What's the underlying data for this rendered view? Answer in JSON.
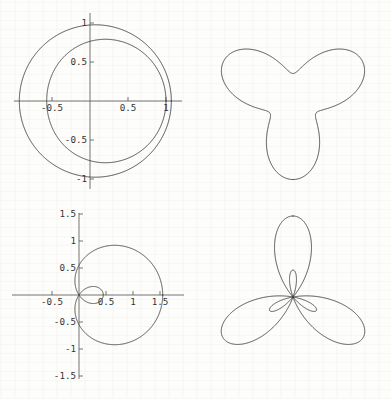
{
  "figure": {
    "width": 391,
    "height": 399,
    "background_color": "#fdfdfb",
    "curve_color": "#3b3b3b",
    "axis_color": "#5a5a5a",
    "layout": "2x2 grid"
  },
  "panels": [
    {
      "id": "top-left",
      "name": "limacon-convex-pair",
      "has_axes": true,
      "x_ticks": [
        "-0.5",
        "0.5",
        "1"
      ],
      "y_ticks": [
        "1",
        "0.5",
        "-0.5",
        "-1"
      ]
    },
    {
      "id": "top-right",
      "name": "rounded-triangle-rose",
      "has_axes": false,
      "x_ticks": [],
      "y_ticks": []
    },
    {
      "id": "bottom-left",
      "name": "limacon-with-inner-loop",
      "has_axes": true,
      "x_ticks": [
        "-0.5",
        "0.5",
        "1",
        "1.5"
      ],
      "y_ticks": [
        "1.5",
        "1",
        "0.5",
        "-0.5",
        "-1",
        "-1.5"
      ]
    },
    {
      "id": "bottom-right",
      "name": "three-petal-rose-with-inner-loops",
      "has_axes": false,
      "x_ticks": [],
      "y_ticks": []
    }
  ],
  "chart_data": [
    {
      "type": "line",
      "subtype": "polar",
      "panel": "top-left",
      "title": "",
      "xlabel": "",
      "ylabel": "",
      "xlim": [
        -1.15,
        1.15
      ],
      "ylim": [
        -1.15,
        1.15
      ],
      "grid": false,
      "axes_visible": true,
      "legend": "none",
      "xticks": [
        -0.5,
        0.5,
        1
      ],
      "xticklabels": [
        "-0.5",
        "0.5",
        "1"
      ],
      "yticks": [
        1,
        0.5,
        -0.5,
        -1
      ],
      "yticklabels": [
        "1",
        "0.5",
        "-0.5",
        "-1"
      ],
      "series": [
        {
          "name": "outer-circle",
          "equation": "r = 1 + 0.07 cos(theta)",
          "description": "near-circular closed curve through x=-1 and x=1.07",
          "theta_range_deg": [
            0,
            360
          ],
          "samples_theta_deg": [
            0,
            45,
            90,
            135,
            180,
            225,
            270,
            315
          ],
          "samples_r": [
            1.07,
            1.05,
            1.0,
            0.95,
            0.93,
            0.95,
            1.0,
            1.05
          ]
        },
        {
          "name": "inner-circle",
          "equation": "r = 0.79 + 0.22 cos(theta)",
          "description": "smaller closed curve through x=-1 at left and x=0.57 at right",
          "theta_range_deg": [
            0,
            360
          ],
          "samples_theta_deg": [
            0,
            45,
            90,
            135,
            180,
            225,
            270,
            315
          ],
          "samples_r": [
            0.57,
            0.7,
            0.62,
            0.84,
            1.0,
            0.84,
            0.62,
            0.7
          ]
        }
      ]
    },
    {
      "type": "line",
      "subtype": "polar",
      "panel": "top-right",
      "title": "",
      "xlabel": "",
      "ylabel": "",
      "grid": false,
      "axes_visible": false,
      "legend": "none",
      "series": [
        {
          "name": "rounded-triangle",
          "equation": "r = 2 + cos(3 theta)",
          "description": "convex rounded triangle, 3-fold symmetry, flat top and rounded bottom vertex",
          "theta_range_deg": [
            0,
            360
          ],
          "samples_theta_deg": [
            0,
            30,
            60,
            90,
            120,
            150,
            180,
            210,
            240,
            270,
            300,
            330
          ],
          "samples_r": [
            3,
            2,
            1,
            2,
            3,
            2,
            1,
            2,
            3,
            2,
            1,
            2
          ]
        }
      ]
    },
    {
      "type": "line",
      "subtype": "polar",
      "panel": "bottom-left",
      "title": "",
      "xlabel": "",
      "ylabel": "",
      "xlim": [
        -0.75,
        1.65
      ],
      "ylim": [
        -1.6,
        1.6
      ],
      "grid": false,
      "axes_visible": true,
      "legend": "none",
      "xticks": [
        -0.5,
        0.5,
        1,
        1.5
      ],
      "xticklabels": [
        "-0.5",
        "0.5",
        "1",
        "1.5"
      ],
      "yticks": [
        1.5,
        1,
        0.5,
        -0.5,
        -1,
        -1.5
      ],
      "yticklabels": [
        "1.5",
        "1",
        "0.5",
        "-0.5",
        "-1",
        "-1.5"
      ],
      "series": [
        {
          "name": "limacon-inner-loop",
          "equation": "r = 0.55 + 1.0 cos(theta)",
          "description": "limacon with inner loop; outer loop reaches x=1.55, inner loop reaches x=-0.6",
          "theta_range_deg": [
            0,
            360
          ],
          "samples_theta_deg": [
            0,
            45,
            90,
            135,
            180,
            225,
            270,
            315
          ],
          "samples_r": [
            1.55,
            1.26,
            0.55,
            -0.16,
            -0.45,
            -0.16,
            0.55,
            1.26
          ]
        }
      ]
    },
    {
      "type": "line",
      "subtype": "polar",
      "panel": "bottom-right",
      "title": "",
      "xlabel": "",
      "ylabel": "",
      "grid": false,
      "axes_visible": false,
      "legend": "none",
      "series": [
        {
          "name": "three-petal-rose",
          "equation": "r = 1 + 2 cos(3 theta)",
          "description": "three large teardrop petals at 90, 210, 330 degrees with three small inner loops near the origin",
          "theta_range_deg": [
            0,
            360
          ],
          "samples_theta_deg": [
            0,
            30,
            60,
            90,
            120,
            150,
            180,
            210,
            240,
            270,
            300,
            330
          ],
          "samples_r": [
            3,
            1,
            -1,
            1,
            3,
            1,
            -1,
            1,
            3,
            1,
            -1,
            1
          ],
          "petal_count": 3,
          "inner_loop_count": 3
        }
      ]
    }
  ]
}
